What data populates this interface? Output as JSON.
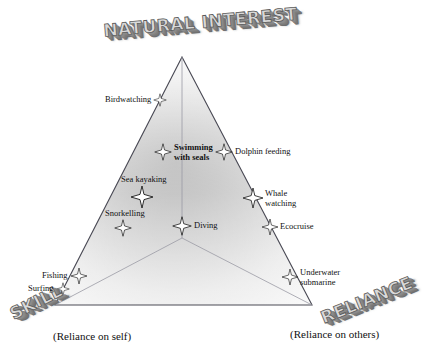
{
  "figure": {
    "type": "ternary-conceptual-diagram",
    "axes": [
      {
        "id": "top",
        "title": "NATURAL INTEREST",
        "subtitle": ""
      },
      {
        "id": "left",
        "title": "SKILL",
        "subtitle": "(Reliance on self)"
      },
      {
        "id": "right",
        "title": "RELIANCE",
        "subtitle": "(Reliance on others)"
      }
    ]
  },
  "chart_data": {
    "type": "scatter",
    "title": "",
    "xlabel": "",
    "ylabel": "",
    "axis_labels": [
      "NATURAL INTEREST",
      "SKILL",
      "RELIANCE"
    ],
    "axis_sublabels": [
      "",
      "(Reliance on self)",
      "(Reliance on others)"
    ],
    "points": [
      {
        "label": "Birdwatching",
        "x": 160,
        "y": 100,
        "size": 13,
        "label_pos": "left",
        "lines": [
          "Birdwatching"
        ]
      },
      {
        "label": "Swimming with seals",
        "x": 163,
        "y": 152,
        "size": 17,
        "label_pos": "right",
        "lines": [
          "Swimming",
          "with seals"
        ]
      },
      {
        "label": "Dolphin feeding",
        "x": 224,
        "y": 152,
        "size": 17,
        "label_pos": "right",
        "lines": [
          "Dolphin feeding"
        ]
      },
      {
        "label": "Sea kayaking",
        "x": 142,
        "y": 197,
        "size": 22,
        "label_pos": "above",
        "lines": [
          "Sea kayaking"
        ]
      },
      {
        "label": "Whale watching",
        "x": 253,
        "y": 198,
        "size": 20,
        "label_pos": "right",
        "lines": [
          "Whale",
          "watching"
        ]
      },
      {
        "label": "Snorkelling",
        "x": 123,
        "y": 228,
        "size": 17,
        "label_pos": "above",
        "lines": [
          "Snorkelling"
        ]
      },
      {
        "label": "Diving",
        "x": 182,
        "y": 226,
        "size": 19,
        "label_pos": "right",
        "lines": [
          "Diving"
        ]
      },
      {
        "label": "Ecocruise",
        "x": 270,
        "y": 227,
        "size": 16,
        "label_pos": "right",
        "lines": [
          "Ecocruise"
        ]
      },
      {
        "label": "Fishing",
        "x": 79,
        "y": 276,
        "size": 16,
        "label_pos": "left",
        "lines": [
          "Fishing"
        ]
      },
      {
        "label": "Underwater submarine",
        "x": 290,
        "y": 277,
        "size": 16,
        "label_pos": "right",
        "lines": [
          "Underwater",
          "submarine"
        ]
      },
      {
        "label": "Surfing",
        "x": 63,
        "y": 289,
        "size": 13,
        "label_pos": "left",
        "lines": [
          "Surfing"
        ]
      }
    ],
    "marker": "four-pointed-star",
    "grid": false,
    "legend": "none"
  },
  "colors": {
    "outline": "#4a4a55",
    "inner_line": "#9a9aa5",
    "fill_light": "#f2f2f2",
    "fill_dark": "#9a9a9a",
    "marker_fill": "#ffffff",
    "marker_stroke": "#1a1a1a",
    "text": "#111111",
    "title_face": "#d9d9d9",
    "title_shadow": "#7f7f7f",
    "background": "#ffffff"
  }
}
